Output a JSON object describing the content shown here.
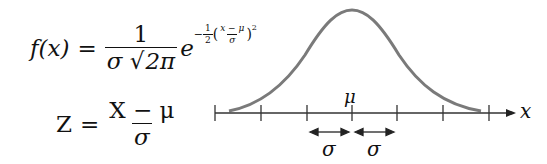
{
  "formulas": {
    "pdf": {
      "lhs": "f(x)",
      "equals": "=",
      "numerator": "1",
      "den_sigma": "σ",
      "den_radical": "√",
      "den_radicand": "2π",
      "exp_base": "e",
      "exp_sign": "−",
      "exp_half_num": "1",
      "exp_half_den": "2",
      "exp_open": "(",
      "exp_inner_num": "x − μ",
      "exp_inner_den": "σ",
      "exp_close": ")",
      "exp_power": "2"
    },
    "zscore": {
      "lhs": "Z",
      "equals": "=",
      "numerator": "X − μ",
      "denominator": "σ"
    }
  },
  "diagram": {
    "axis_label": "x",
    "mean_label": "μ",
    "sigma_left_label": "σ",
    "sigma_right_label": "σ",
    "curve_color": "#7a7a7a",
    "axis_color": "#333333",
    "tick_count": 7
  }
}
